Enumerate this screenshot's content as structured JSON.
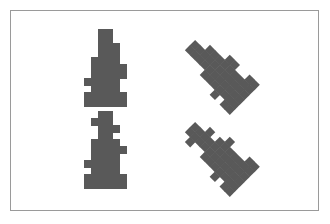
{
  "canvas": {
    "width": 330,
    "height": 224,
    "background_color": "#ffffff",
    "border_color": "#9a9a9a",
    "border_width": 1,
    "frame_left": 10,
    "frame_top": 10,
    "frame_width": 309,
    "frame_height": 201
  },
  "palette": {
    "shape_fill": "#595959",
    "page_background": "#ffffff",
    "frame_stroke": "#9a9a9a"
  },
  "shapes": {
    "count": 4,
    "fill_color": "#595959",
    "grid_unit": 7,
    "items": [
      {
        "id": "glyph-upright-top",
        "name": "microscope-glyph-a-upright",
        "variant": "A",
        "rotation_degrees": 0,
        "column": "left",
        "row": "top",
        "x": 66,
        "y": 18,
        "width": 70,
        "height": 77,
        "cells": [
          [
            3,
            0
          ],
          [
            4,
            0
          ],
          [
            3,
            1
          ],
          [
            4,
            1
          ],
          [
            3,
            2
          ],
          [
            4,
            2
          ],
          [
            5,
            2
          ],
          [
            3,
            3
          ],
          [
            4,
            3
          ],
          [
            5,
            3
          ],
          [
            2,
            4
          ],
          [
            3,
            4
          ],
          [
            4,
            4
          ],
          [
            5,
            4
          ],
          [
            2,
            5
          ],
          [
            3,
            5
          ],
          [
            4,
            5
          ],
          [
            5,
            5
          ],
          [
            6,
            5
          ],
          [
            2,
            6
          ],
          [
            3,
            6
          ],
          [
            4,
            6
          ],
          [
            5,
            6
          ],
          [
            6,
            6
          ],
          [
            1,
            7
          ],
          [
            2,
            7
          ],
          [
            3,
            7
          ],
          [
            4,
            7
          ],
          [
            5,
            7
          ],
          [
            2,
            8
          ],
          [
            3,
            8
          ],
          [
            4,
            8
          ],
          [
            5,
            8
          ],
          [
            1,
            9
          ],
          [
            2,
            9
          ],
          [
            3,
            9
          ],
          [
            4,
            9
          ],
          [
            5,
            9
          ],
          [
            6,
            9
          ],
          [
            1,
            10
          ],
          [
            2,
            10
          ],
          [
            3,
            10
          ],
          [
            4,
            10
          ],
          [
            5,
            10
          ],
          [
            6,
            10
          ]
        ]
      },
      {
        "id": "glyph-upright-bottom",
        "name": "microscope-glyph-b-upright",
        "variant": "B",
        "rotation_degrees": 0,
        "column": "left",
        "row": "bottom",
        "x": 66,
        "y": 100,
        "width": 70,
        "height": 77,
        "cells": [
          [
            3,
            0
          ],
          [
            4,
            0
          ],
          [
            2,
            1
          ],
          [
            3,
            1
          ],
          [
            4,
            1
          ],
          [
            3,
            2
          ],
          [
            4,
            2
          ],
          [
            5,
            2
          ],
          [
            3,
            3
          ],
          [
            4,
            3
          ],
          [
            2,
            4
          ],
          [
            3,
            4
          ],
          [
            4,
            4
          ],
          [
            5,
            4
          ],
          [
            2,
            5
          ],
          [
            3,
            5
          ],
          [
            4,
            5
          ],
          [
            5,
            5
          ],
          [
            6,
            5
          ],
          [
            2,
            6
          ],
          [
            3,
            6
          ],
          [
            4,
            6
          ],
          [
            5,
            6
          ],
          [
            1,
            7
          ],
          [
            2,
            7
          ],
          [
            3,
            7
          ],
          [
            4,
            7
          ],
          [
            5,
            7
          ],
          [
            2,
            8
          ],
          [
            3,
            8
          ],
          [
            4,
            8
          ],
          [
            5,
            8
          ],
          [
            1,
            9
          ],
          [
            2,
            9
          ],
          [
            3,
            9
          ],
          [
            4,
            9
          ],
          [
            5,
            9
          ],
          [
            6,
            9
          ],
          [
            1,
            10
          ],
          [
            2,
            10
          ],
          [
            3,
            10
          ],
          [
            4,
            10
          ],
          [
            5,
            10
          ],
          [
            6,
            10
          ]
        ]
      },
      {
        "id": "glyph-rotated-top",
        "name": "microscope-glyph-a-rotated",
        "variant": "A",
        "rotation_degrees": -45,
        "column": "right",
        "row": "top",
        "x": 176,
        "y": 18,
        "width": 70,
        "height": 77,
        "cells": [
          [
            3,
            0
          ],
          [
            4,
            0
          ],
          [
            3,
            1
          ],
          [
            4,
            1
          ],
          [
            3,
            2
          ],
          [
            4,
            2
          ],
          [
            5,
            2
          ],
          [
            3,
            3
          ],
          [
            4,
            3
          ],
          [
            5,
            3
          ],
          [
            2,
            4
          ],
          [
            3,
            4
          ],
          [
            4,
            4
          ],
          [
            5,
            4
          ],
          [
            2,
            5
          ],
          [
            3,
            5
          ],
          [
            4,
            5
          ],
          [
            5,
            5
          ],
          [
            6,
            5
          ],
          [
            2,
            6
          ],
          [
            3,
            6
          ],
          [
            4,
            6
          ],
          [
            5,
            6
          ],
          [
            6,
            6
          ],
          [
            1,
            7
          ],
          [
            2,
            7
          ],
          [
            3,
            7
          ],
          [
            4,
            7
          ],
          [
            5,
            7
          ],
          [
            2,
            8
          ],
          [
            3,
            8
          ],
          [
            4,
            8
          ],
          [
            5,
            8
          ],
          [
            1,
            9
          ],
          [
            2,
            9
          ],
          [
            3,
            9
          ],
          [
            4,
            9
          ],
          [
            5,
            9
          ],
          [
            6,
            9
          ],
          [
            1,
            10
          ],
          [
            2,
            10
          ],
          [
            3,
            10
          ],
          [
            4,
            10
          ],
          [
            5,
            10
          ],
          [
            6,
            10
          ]
        ]
      },
      {
        "id": "glyph-rotated-bottom",
        "name": "microscope-glyph-b-rotated",
        "variant": "B",
        "rotation_degrees": -45,
        "column": "right",
        "row": "bottom",
        "x": 176,
        "y": 100,
        "width": 70,
        "height": 77,
        "cells": [
          [
            3,
            0
          ],
          [
            4,
            0
          ],
          [
            2,
            1
          ],
          [
            3,
            1
          ],
          [
            4,
            1
          ],
          [
            3,
            2
          ],
          [
            4,
            2
          ],
          [
            5,
            2
          ],
          [
            3,
            3
          ],
          [
            4,
            3
          ],
          [
            2,
            4
          ],
          [
            3,
            4
          ],
          [
            4,
            4
          ],
          [
            5,
            4
          ],
          [
            2,
            5
          ],
          [
            3,
            5
          ],
          [
            4,
            5
          ],
          [
            5,
            5
          ],
          [
            6,
            5
          ],
          [
            2,
            6
          ],
          [
            3,
            6
          ],
          [
            4,
            6
          ],
          [
            5,
            6
          ],
          [
            1,
            7
          ],
          [
            2,
            7
          ],
          [
            3,
            7
          ],
          [
            4,
            7
          ],
          [
            5,
            7
          ],
          [
            2,
            8
          ],
          [
            3,
            8
          ],
          [
            4,
            8
          ],
          [
            5,
            8
          ],
          [
            1,
            9
          ],
          [
            2,
            9
          ],
          [
            3,
            9
          ],
          [
            4,
            9
          ],
          [
            5,
            9
          ],
          [
            6,
            9
          ],
          [
            1,
            10
          ],
          [
            2,
            10
          ],
          [
            3,
            10
          ],
          [
            4,
            10
          ],
          [
            5,
            10
          ],
          [
            6,
            10
          ]
        ]
      }
    ]
  }
}
